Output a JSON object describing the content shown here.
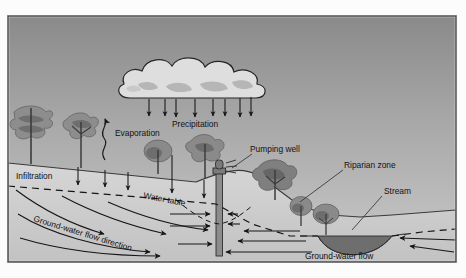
{
  "figure": {
    "kind": "hydrologic-cycle-cross-section",
    "background_color": "#ffffff",
    "frame": {
      "x": 8,
      "y": 16,
      "width": 448,
      "height": 246,
      "border_color": "#5a5a5a"
    },
    "sky": {
      "top_color": "#8d8d8d",
      "bottom_color": "#c9c9c9"
    },
    "ground": {
      "fill_color": "#cfcfcf",
      "outline_color": "#3a3a3a"
    },
    "aquifer": {
      "fill_color": "#c4c4c4"
    },
    "water_color": "#6e6e6e",
    "cloud": {
      "fill_color": "#dcdcdc",
      "shade_color": "#b4b4b4",
      "outline_color": "#2b2b2b"
    },
    "tree_color": "#8a8a8a",
    "tree_dark_color": "#6f6f6f",
    "trunk_color": "#3c3c3c",
    "arrow_color": "#1b1b1b",
    "dash_color": "#1b1b1b"
  },
  "labels": {
    "precipitation": "Precipitation",
    "evaporation": "Evaporation",
    "infiltration": "Infiltration",
    "water_table": "Water  table",
    "ground_water_flow_direction": "Ground-water flow direction",
    "pumping_well": "Pumping well",
    "riparian_zone": "Riparian zone",
    "stream": "Stream",
    "ground_water_flow": "Ground-water flow"
  },
  "elements": {
    "cloud_name": "rain-cloud",
    "well_name": "pumping-well",
    "stream_name": "stream-channel",
    "water_table_name": "water-table-line"
  }
}
